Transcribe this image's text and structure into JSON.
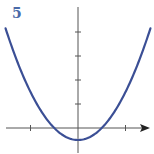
{
  "figure": {
    "label": "5"
  },
  "colors": {
    "curve": "#3b4f95",
    "axis": "#555555",
    "label": "#4a6aa8"
  },
  "chart_data": {
    "type": "line",
    "title": "",
    "panel_label": "5",
    "xlabel": "",
    "ylabel": "",
    "function": "y = 0.5*x^2 - 0.5",
    "x": [
      -3,
      -2.5,
      -2,
      -1.5,
      -1,
      -0.5,
      0,
      0.5,
      1,
      1.5,
      2,
      2.5,
      3
    ],
    "series": [
      {
        "name": "parabola",
        "values": [
          4,
          2.625,
          1.5,
          0.625,
          0,
          -0.375,
          -0.5,
          -0.375,
          0,
          0.625,
          1.5,
          2.625,
          4
        ]
      }
    ],
    "x_ticks": [
      -2,
      2
    ],
    "y_ticks": [
      1,
      2,
      3,
      4
    ],
    "xlim": [
      -3.3,
      3.1
    ],
    "ylim": [
      -1,
      5
    ],
    "grid": false,
    "legend": false,
    "tick_labels_shown": false
  }
}
